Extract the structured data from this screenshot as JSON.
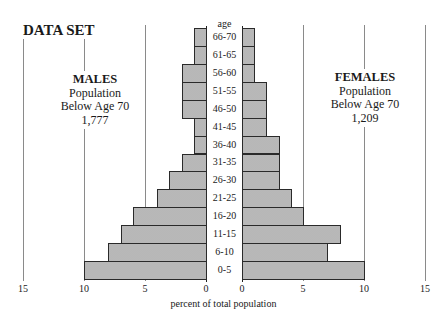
{
  "title": "DATA SET",
  "males": {
    "heading": "MALES",
    "line1": "Population",
    "line2": "Below Age 70",
    "total": "1,777"
  },
  "females": {
    "heading": "FEMALES",
    "line1": "Population",
    "line2": "Below Age 70",
    "total": "1,209"
  },
  "age_axis_label": "age",
  "x_axis_label": "percent of total population",
  "left_ticks": [
    "15",
    "10",
    "5",
    "0"
  ],
  "right_ticks": [
    "0",
    "5",
    "10",
    "15"
  ],
  "colors": {
    "bar_fill": "#c4c4c4",
    "bar_border": "#2a2a2a",
    "grid": "#8a8a8a"
  },
  "chart_data": {
    "type": "bar",
    "subtype": "population-pyramid",
    "title": "DATA SET",
    "xlabel": "percent of total population",
    "ylabel": "age",
    "xlim": [
      0,
      15
    ],
    "x_ticks": [
      0,
      5,
      10,
      15
    ],
    "grid": true,
    "categories": [
      "66-70",
      "61-65",
      "56-60",
      "51-55",
      "46-50",
      "41-45",
      "36-40",
      "31-35",
      "26-30",
      "21-25",
      "16-20",
      "11-15",
      "6-10",
      "0-5"
    ],
    "series": [
      {
        "name": "MALES",
        "side": "left",
        "total_below_70": "1,777",
        "values": [
          1,
          1,
          2,
          2,
          2,
          1,
          1,
          2,
          3,
          4,
          6,
          7,
          8,
          10
        ]
      },
      {
        "name": "FEMALES",
        "side": "right",
        "total_below_70": "1,209",
        "values": [
          1,
          1,
          1,
          2,
          2,
          2,
          3,
          3,
          3,
          4,
          5,
          8,
          7,
          10
        ]
      }
    ]
  }
}
